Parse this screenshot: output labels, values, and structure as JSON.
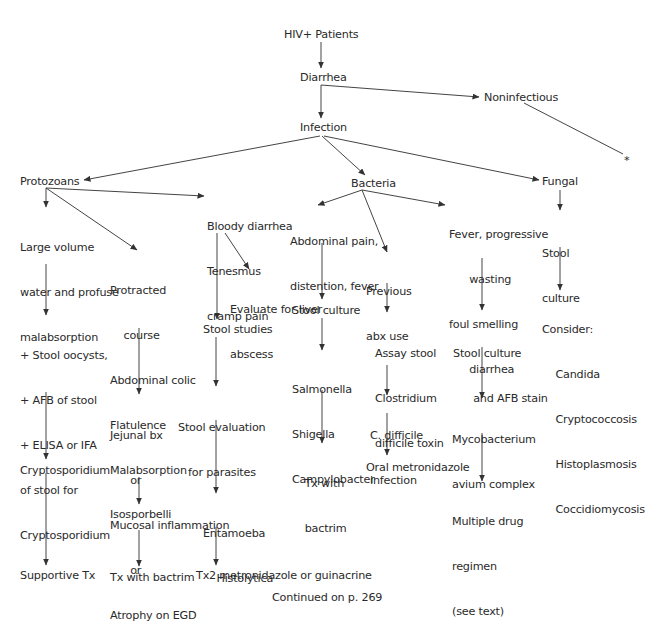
{
  "diagram": {
    "type": "flowchart",
    "title": "HIV+ Patients",
    "nodes": {
      "hiv": [
        "HIV+ Patients"
      ],
      "diarrhea": [
        "Diarrhea"
      ],
      "noninfectious": [
        "Noninfectious"
      ],
      "asterisk": [
        "*"
      ],
      "infection": [
        "Infection"
      ],
      "protozoans": [
        "Protozoans"
      ],
      "bacteria": [
        "Bacteria"
      ],
      "fungal": [
        "Fungal"
      ],
      "large_volume": [
        "Large volume",
        "water and profuse",
        "malabsorption"
      ],
      "protracted": [
        "Protracted",
        "    course",
        "Abdominal colic",
        "Flatulence",
        "Malabsorption"
      ],
      "bloody": [
        "Bloody diarrhea",
        "Tenesmus",
        "cramp pain"
      ],
      "abdominal_pain": [
        "Abdominal pain,",
        "distention, fever"
      ],
      "previous_abx": [
        "Previous",
        "abx use"
      ],
      "fever_wasting": [
        "Fever, progressive",
        "      wasting",
        "foul smelling",
        "      diarrhea"
      ],
      "fungal_stool_culture": [
        "Stool",
        "culture"
      ],
      "evaluate_liver": [
        "Evaluate for liver",
        "abscess"
      ],
      "stool_culture_bact": [
        "Stool culture"
      ],
      "consider": [
        "Consider:",
        "    Candida",
        "    Cryptococcosis",
        "    Histoplasmosis",
        "    Coccidiomycosis"
      ],
      "stool_oocysts": [
        "+ Stool oocysts,",
        "+ AFB of stool",
        "+ ELISA or IFA",
        "of stool for",
        "Cryptosporidium"
      ],
      "stool_studies": [
        "Stool studies"
      ],
      "assay_stool": [
        "Assay stool",
        "Clostridium",
        "difficile toxin"
      ],
      "stool_culture_afb": [
        "Stool culture",
        "      and AFB stain"
      ],
      "salmonella": [
        "Salmonella",
        "Shigella",
        "Campylobacter"
      ],
      "jejunal": [
        "Jejunal bx",
        "      or",
        "Mucosal inflammation",
        "      or",
        "Atrophy on EGD"
      ],
      "stool_eval_parasites": [
        "Stool evaluation",
        "   for parasites"
      ],
      "c_difficile": [
        "C. difficile",
        "infection"
      ],
      "mycobacterium": [
        "Mycobacterium",
        "avium complex"
      ],
      "tx_bactrim_bact": [
        "  Tx with",
        "  bactrim"
      ],
      "oral_metronidazole": [
        "Oral metronidazole"
      ],
      "multiple_drug": [
        "Multiple drug",
        "regimen",
        "(see text)"
      ],
      "cryptosporidium": [
        "Cryptosporidium"
      ],
      "isosporbelli": [
        "Isosporbelli"
      ],
      "entamoeba": [
        "Entamoeba",
        "    Histolytica"
      ],
      "supportive_tx": [
        "Supportive Tx"
      ],
      "tx_bactrim_proto": [
        "Tx with bactrim"
      ],
      "tx2_metronidazole": [
        "Tx2 metronidazole or guinacrine"
      ]
    },
    "footer": "Continued on p. 269",
    "edges": [
      [
        "hiv",
        "diarrhea"
      ],
      [
        "diarrhea",
        "infection"
      ],
      [
        "diarrhea",
        "noninfectious"
      ],
      [
        "noninfectious",
        "asterisk"
      ],
      [
        "infection",
        "protozoans"
      ],
      [
        "infection",
        "bacteria"
      ],
      [
        "infection",
        "fungal"
      ],
      [
        "protozoans",
        "large_volume"
      ],
      [
        "protozoans",
        "protracted"
      ],
      [
        "protozoans",
        "bloody"
      ],
      [
        "bacteria",
        "abdominal_pain"
      ],
      [
        "bacteria",
        "previous_abx"
      ],
      [
        "bacteria",
        "fever_wasting"
      ],
      [
        "fungal",
        "fungal_stool_culture"
      ],
      [
        "fungal_stool_culture",
        "consider"
      ],
      [
        "bloody",
        "evaluate_liver"
      ],
      [
        "bloody",
        "stool_studies"
      ],
      [
        "large_volume",
        "stool_oocysts"
      ],
      [
        "stool_oocysts",
        "cryptosporidium"
      ],
      [
        "cryptosporidium",
        "supportive_tx"
      ],
      [
        "protracted",
        "jejunal"
      ],
      [
        "jejunal",
        "isosporbelli"
      ],
      [
        "isosporbelli",
        "tx_bactrim_proto"
      ],
      [
        "stool_studies",
        "stool_eval_parasites"
      ],
      [
        "stool_eval_parasites",
        "entamoeba"
      ],
      [
        "entamoeba",
        "tx2_metronidazole"
      ],
      [
        "abdominal_pain",
        "stool_culture_bact"
      ],
      [
        "stool_culture_bact",
        "salmonella"
      ],
      [
        "salmonella",
        "tx_bactrim_bact"
      ],
      [
        "previous_abx",
        "assay_stool"
      ],
      [
        "assay_stool",
        "c_difficile"
      ],
      [
        "c_difficile",
        "oral_metronidazole"
      ],
      [
        "fever_wasting",
        "stool_culture_afb"
      ],
      [
        "stool_culture_afb",
        "mycobacterium"
      ],
      [
        "mycobacterium",
        "multiple_drug"
      ]
    ],
    "colors": {
      "text": "#2a2a2a",
      "lines": "#333333",
      "background": "#ffffff"
    }
  }
}
